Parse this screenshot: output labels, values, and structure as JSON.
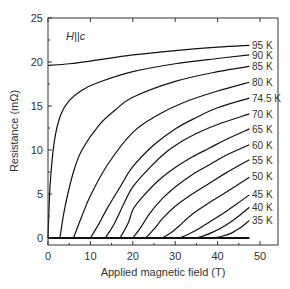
{
  "chart_data": {
    "type": "line",
    "title": "",
    "annotation": "H||c",
    "xlabel": "Applied magnetic field (T)",
    "ylabel": "Resistance (mΩ)",
    "xlim": [
      0,
      54.3
    ],
    "ylim": [
      -0.8,
      25
    ],
    "xticks": [
      0,
      10,
      20,
      30,
      40,
      50
    ],
    "yticks": [
      0,
      5,
      10,
      15,
      20,
      25
    ],
    "grid": false,
    "legend_position": "inline-right",
    "series": [
      {
        "name": "95 K",
        "x": [
          0,
          5,
          10,
          20,
          30,
          40,
          47.5
        ],
        "values": [
          19.6,
          19.8,
          20.1,
          20.8,
          21.3,
          21.7,
          21.9
        ]
      },
      {
        "name": "90 K",
        "x": [
          0,
          0.5,
          1.5,
          3,
          5,
          8,
          12,
          20,
          30,
          40,
          47.5
        ],
        "values": [
          0,
          6,
          11,
          14,
          15.6,
          16.8,
          17.7,
          18.9,
          19.8,
          20.4,
          20.8
        ]
      },
      {
        "name": "85 K",
        "x": [
          2.8,
          4,
          6,
          8,
          12,
          16,
          20,
          30,
          40,
          47.5
        ],
        "values": [
          0,
          3.5,
          7.5,
          10,
          12.8,
          14.6,
          16.0,
          17.8,
          18.9,
          19.5
        ]
      },
      {
        "name": "80 K",
        "x": [
          6,
          8,
          10,
          14,
          20,
          26,
          32,
          40,
          47.5
        ],
        "values": [
          0,
          2.5,
          4.8,
          8.3,
          12.0,
          14.0,
          15.4,
          16.7,
          17.7
        ]
      },
      {
        "name": "74.5 K",
        "x": [
          10,
          12,
          14,
          17,
          20,
          25,
          30,
          35,
          40,
          47.5
        ],
        "values": [
          0,
          1.6,
          3.4,
          5.8,
          8.1,
          10.6,
          12.4,
          13.7,
          14.8,
          15.9
        ]
      },
      {
        "name": "70 K",
        "x": [
          13.5,
          15.5,
          18,
          20,
          24,
          28,
          32,
          36,
          40,
          47.5
        ],
        "values": [
          0,
          1.5,
          4.0,
          5.8,
          8.0,
          9.8,
          11.1,
          12.1,
          12.9,
          14.1
        ]
      },
      {
        "name": "65 K",
        "x": [
          17,
          19,
          20,
          22,
          26,
          30,
          34,
          38,
          42,
          47.5
        ],
        "values": [
          0,
          1.8,
          3.2,
          4.5,
          6.5,
          8.0,
          9.2,
          10.2,
          11.2,
          12.4
        ]
      },
      {
        "name": "60 K",
        "x": [
          20,
          22,
          24,
          27,
          30,
          34,
          38,
          42,
          47.5
        ],
        "values": [
          0,
          1.3,
          2.8,
          4.5,
          5.8,
          7.2,
          8.3,
          9.4,
          10.6
        ]
      },
      {
        "name": "55 K",
        "x": [
          23,
          25,
          27,
          30,
          34,
          38,
          42,
          47.5
        ],
        "values": [
          0,
          1.0,
          2.2,
          3.6,
          5.0,
          6.2,
          7.4,
          8.9
        ]
      },
      {
        "name": "50 K",
        "x": [
          27,
          29,
          31,
          34,
          38,
          42,
          47.5
        ],
        "values": [
          0,
          0.6,
          1.4,
          2.7,
          4.0,
          5.2,
          6.9
        ]
      },
      {
        "name": "45 K",
        "x": [
          31,
          33,
          35,
          38,
          41,
          44,
          47.5
        ],
        "values": [
          0,
          0.4,
          0.9,
          1.8,
          2.7,
          3.7,
          4.9
        ]
      },
      {
        "name": "40 K",
        "x": [
          35,
          37,
          39,
          41,
          43,
          45,
          47.5
        ],
        "values": [
          0,
          0.3,
          0.7,
          1.2,
          1.8,
          2.5,
          3.5
        ]
      },
      {
        "name": "35 K",
        "x": [
          39,
          41,
          43,
          44.5,
          46,
          47.5
        ],
        "values": [
          0,
          0.2,
          0.5,
          0.9,
          1.4,
          2.0
        ]
      }
    ],
    "labels": [
      {
        "text": "95 K",
        "y": 21.9
      },
      {
        "text": "90 K",
        "y": 20.8
      },
      {
        "text": "85 K",
        "y": 19.5
      },
      {
        "text": "80 K",
        "y": 17.7
      },
      {
        "text": "74.5 K",
        "y": 15.9
      },
      {
        "text": "70 K",
        "y": 14.1
      },
      {
        "text": "65 K",
        "y": 12.4
      },
      {
        "text": "60 K",
        "y": 10.6
      },
      {
        "text": "55 K",
        "y": 8.9
      },
      {
        "text": "50 K",
        "y": 7.0
      },
      {
        "text": "45 K",
        "y": 5.0
      },
      {
        "text": "40 K",
        "y": 3.5
      },
      {
        "text": "35 K",
        "y": 2.0
      }
    ],
    "line_color": "#111111",
    "axis_color": "#333333"
  }
}
